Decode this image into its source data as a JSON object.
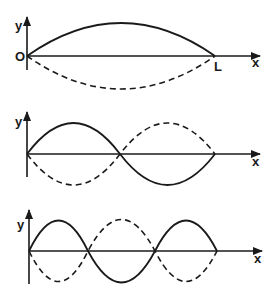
{
  "diagram": {
    "panels": [
      {
        "id": "mode-1",
        "y_label": "y",
        "x_label": "x",
        "origin_label": "O",
        "end_label": "L",
        "loops": 1
      },
      {
        "id": "mode-2",
        "y_label": "y",
        "x_label": "x",
        "loops": 2
      },
      {
        "id": "mode-3",
        "y_label": "y",
        "x_label": "x",
        "loops": 3
      }
    ],
    "colors": {
      "ink": "#1a1a1a",
      "background": "#ffffff"
    }
  }
}
